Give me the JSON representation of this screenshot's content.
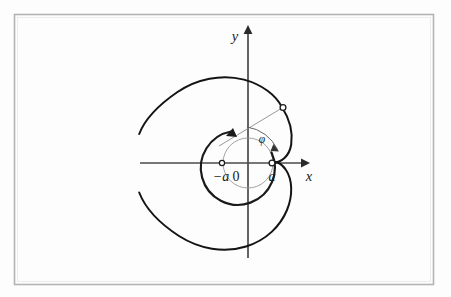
{
  "figure": {
    "kind": "cardioid-polar-diagram",
    "background_color": "#fdfdfd",
    "frame": {
      "name": "plot-frame",
      "color": "#b4b4b4",
      "x": 14,
      "y": 14,
      "width": 420,
      "height": 271
    },
    "curve_color": "#111111",
    "axis_color": "#555555",
    "helper_color": "#8c8c8c",
    "origin": {
      "x": 248,
      "y": 163
    },
    "scale_a": 25
  },
  "axes": {
    "x_axis": {
      "label": "x",
      "label_x": 308,
      "label_y": 180,
      "x_start": 140,
      "x_end": 303,
      "y": 163
    },
    "y_axis": {
      "label": "y",
      "label_x": 236,
      "label_y": 40,
      "y_start": 258,
      "y_end": 28,
      "x": 248
    }
  },
  "labels": {
    "origin": "0",
    "origin_x": 236,
    "origin_y": 180,
    "neg_a": "−a",
    "neg_a_x": 214,
    "neg_a_y": 180,
    "pos_a": "a",
    "pos_a_x": 269,
    "pos_a_y": 180,
    "phi": "φ",
    "phi_x": 262,
    "phi_y": 142
  },
  "markers": [
    {
      "name": "point-neg-a",
      "x": 222,
      "y": 163,
      "r": 2.6
    },
    {
      "name": "point-pos-a",
      "x": 272,
      "y": 163,
      "r": 2.8
    },
    {
      "name": "point-on-curve",
      "x": 283,
      "y": 108,
      "r": 2.8
    }
  ],
  "helper_circle": {
    "name": "reference-circle",
    "cx": 248,
    "cy": 163,
    "r": 25
  },
  "radius_ray": {
    "name": "radius-vector",
    "x1": 220,
    "y1": 146,
    "x2": 283,
    "y2": 108
  },
  "angle_arcs": [
    {
      "name": "angle-arc-thick",
      "path": "M 232 132 A 36 36 0 1 0 272 153"
    },
    {
      "name": "angle-arc-thin",
      "path": "M 246 128 A 40 40 0 0 1 278 150"
    }
  ],
  "cardioid_path": "M 282.2 107.0 C 275.5 95.0 262.5 84.0 245.0 79.5 C 222.0 73.5 196.0 78.5 177.0 91.5 C 157.5 104.5 144.0 119.5 138.8 133.5 M 138.8 192.0 C 144.0 206.5 158.0 222.5 178.0 235.5 C 198.0 248.5 223.0 253.0 245.5 246.5 C 266.5 240.5 280.0 226.0 286.5 210.5 C 292.5 196.0 292.0 180.0 286.0 170.0 C 281.0 161.5 274.5 160.5 271.8 163.0 C 269.5 165.0 271.0 169.5 275.5 173.0",
  "cardioid_path_upper_tail": "M 282.2 107.0 C 289.0 118.0 292.5 131.0 291.0 143.0 C 289.5 155.0 282.0 163.0 272.2 163.0",
  "cardioid_gap_note": "curve is drawn with a break on the far left"
}
